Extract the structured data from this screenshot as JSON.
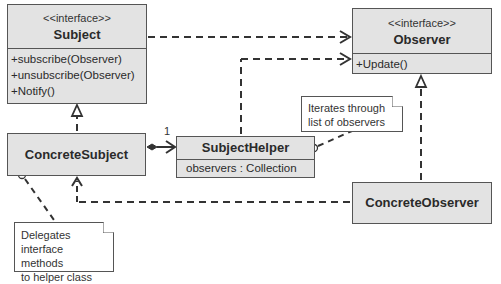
{
  "diagram": {
    "type": "UML class diagram",
    "pattern": "Observer with helper delegation"
  },
  "classes": {
    "subject": {
      "stereotype": "<<interface>>",
      "name": "Subject",
      "methods": [
        "+subscribe(Observer)",
        "+unsubscribe(Observer)",
        "+Notify()"
      ]
    },
    "observer": {
      "stereotype": "<<interface>>",
      "name": "Observer",
      "methods": [
        "+Update()"
      ]
    },
    "concrete_subject": {
      "name": "ConcreteSubject"
    },
    "subject_helper": {
      "name": "SubjectHelper",
      "attributes": [
        "observers : Collection"
      ]
    },
    "concrete_observer": {
      "name": "ConcreteObserver"
    }
  },
  "notes": {
    "iterates": [
      "Iterates through",
      "list of observers"
    ],
    "delegates": [
      "Delegates",
      "interface methods",
      "to helper class"
    ]
  },
  "relationships": [
    {
      "from": "Subject",
      "to": "Observer",
      "kind": "dependency"
    },
    {
      "from": "SubjectHelper",
      "to": "Observer",
      "kind": "dependency"
    },
    {
      "from": "ConcreteSubject",
      "to": "Subject",
      "kind": "realization"
    },
    {
      "from": "ConcreteObserver",
      "to": "Observer",
      "kind": "realization"
    },
    {
      "from": "ConcreteSubject",
      "to": "SubjectHelper",
      "kind": "composition",
      "multiplicity": "1"
    },
    {
      "from": "ConcreteObserver",
      "to": "ConcreteSubject",
      "kind": "dependency"
    }
  ],
  "labels": {
    "composition_multiplicity": "1"
  },
  "colors": {
    "class_fill": "#e3e3e3",
    "stroke": "#555555",
    "note_fill": "#ffffff"
  }
}
